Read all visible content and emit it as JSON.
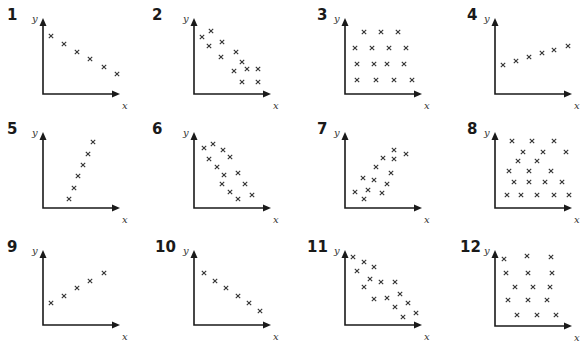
{
  "chart_data": [
    {
      "id": "1",
      "type": "scatter",
      "title": "1",
      "xlabel": "x",
      "ylabel": "y",
      "origin": [
        43,
        94
      ],
      "y_top": 18,
      "x_end": 120,
      "label_pos": [
        7,
        20
      ],
      "points": [
        [
          51,
          36
        ],
        [
          64,
          44
        ],
        [
          77,
          52
        ],
        [
          90,
          59
        ],
        [
          104,
          67
        ],
        [
          117,
          74
        ]
      ],
      "description": "perfect negative linear"
    },
    {
      "id": "2",
      "type": "scatter",
      "title": "2",
      "xlabel": "x",
      "ylabel": "y",
      "origin": [
        194,
        94
      ],
      "y_top": 18,
      "x_end": 271,
      "label_pos": [
        152,
        20
      ],
      "points": [
        [
          202,
          37
        ],
        [
          211,
          31
        ],
        [
          209,
          46
        ],
        [
          222,
          42
        ],
        [
          221,
          57
        ],
        [
          236,
          52
        ],
        [
          242,
          62
        ],
        [
          234,
          71
        ],
        [
          247,
          69
        ],
        [
          258,
          69
        ],
        [
          242,
          82
        ],
        [
          258,
          82
        ]
      ],
      "description": "strong negative"
    },
    {
      "id": "3",
      "type": "scatter",
      "title": "3",
      "xlabel": "x",
      "ylabel": "y",
      "origin": [
        345,
        94
      ],
      "y_top": 18,
      "x_end": 422,
      "label_pos": [
        317,
        20
      ],
      "points": [
        [
          364,
          32
        ],
        [
          381,
          32
        ],
        [
          398,
          32
        ],
        [
          355,
          48
        ],
        [
          372,
          48
        ],
        [
          389,
          48
        ],
        [
          406,
          48
        ],
        [
          357,
          64
        ],
        [
          374,
          64
        ],
        [
          387,
          64
        ],
        [
          404,
          64
        ],
        [
          357,
          80
        ],
        [
          376,
          80
        ],
        [
          394,
          80
        ],
        [
          412,
          80
        ]
      ],
      "description": "no correlation"
    },
    {
      "id": "4",
      "type": "scatter",
      "title": "4",
      "xlabel": "x",
      "ylabel": "y",
      "origin": [
        495,
        94
      ],
      "y_top": 18,
      "x_end": 572,
      "label_pos": [
        467,
        20
      ],
      "points": [
        [
          503,
          65
        ],
        [
          516,
          61
        ],
        [
          529,
          57
        ],
        [
          542,
          53
        ],
        [
          554,
          50
        ],
        [
          568,
          46
        ]
      ],
      "description": "perfect positive linear (shallow)"
    },
    {
      "id": "5",
      "type": "scatter",
      "title": "5",
      "xlabel": "x",
      "ylabel": "y",
      "origin": [
        43,
        208
      ],
      "y_top": 132,
      "x_end": 120,
      "label_pos": [
        7,
        134
      ],
      "points": [
        [
          69,
          199
        ],
        [
          74,
          188
        ],
        [
          78,
          176
        ],
        [
          83,
          165
        ],
        [
          88,
          154
        ],
        [
          93,
          142
        ]
      ],
      "description": "perfect positive linear (steep)"
    },
    {
      "id": "6",
      "type": "scatter",
      "title": "6",
      "xlabel": "x",
      "ylabel": "y",
      "origin": [
        194,
        208
      ],
      "y_top": 132,
      "x_end": 271,
      "label_pos": [
        152,
        134
      ],
      "points": [
        [
          204,
          148
        ],
        [
          213,
          144
        ],
        [
          223,
          150
        ],
        [
          230,
          157
        ],
        [
          209,
          159
        ],
        [
          217,
          167
        ],
        [
          224,
          175
        ],
        [
          238,
          173
        ],
        [
          222,
          184
        ],
        [
          245,
          184
        ],
        [
          230,
          192
        ],
        [
          252,
          195
        ],
        [
          238,
          199
        ]
      ],
      "description": "negative"
    },
    {
      "id": "7",
      "type": "scatter",
      "title": "7",
      "xlabel": "x",
      "ylabel": "y",
      "origin": [
        345,
        208
      ],
      "y_top": 132,
      "x_end": 422,
      "label_pos": [
        317,
        134
      ],
      "points": [
        [
          355,
          192
        ],
        [
          364,
          199
        ],
        [
          368,
          190
        ],
        [
          363,
          178
        ],
        [
          374,
          180
        ],
        [
          382,
          193
        ],
        [
          387,
          184
        ],
        [
          376,
          167
        ],
        [
          391,
          173
        ],
        [
          383,
          158
        ],
        [
          394,
          150
        ],
        [
          394,
          159
        ],
        [
          406,
          154
        ]
      ],
      "description": "positive"
    },
    {
      "id": "8",
      "type": "scatter",
      "title": "8",
      "xlabel": "x",
      "ylabel": "y",
      "origin": [
        495,
        208
      ],
      "y_top": 132,
      "x_end": 572,
      "label_pos": [
        467,
        134
      ],
      "points": [
        [
          512,
          141
        ],
        [
          532,
          141
        ],
        [
          554,
          141
        ],
        [
          523,
          152
        ],
        [
          543,
          152
        ],
        [
          566,
          152
        ],
        [
          518,
          161
        ],
        [
          537,
          161
        ],
        [
          509,
          171
        ],
        [
          529,
          171
        ],
        [
          551,
          171
        ],
        [
          514,
          182
        ],
        [
          529,
          182
        ],
        [
          545,
          182
        ],
        [
          562,
          182
        ],
        [
          507,
          195
        ],
        [
          521,
          195
        ],
        [
          537,
          195
        ],
        [
          554,
          195
        ],
        [
          569,
          195
        ]
      ],
      "description": "no correlation"
    },
    {
      "id": "9",
      "type": "scatter",
      "title": "9",
      "xlabel": "x",
      "ylabel": "y",
      "origin": [
        43,
        325
      ],
      "y_top": 250,
      "x_end": 120,
      "label_pos": [
        7,
        252
      ],
      "points": [
        [
          51,
          303
        ],
        [
          64,
          296
        ],
        [
          77,
          288
        ],
        [
          90,
          281
        ],
        [
          104,
          273
        ]
      ],
      "description": "perfect positive linear"
    },
    {
      "id": "10",
      "type": "scatter",
      "title": "10",
      "xlabel": "x",
      "ylabel": "y",
      "origin": [
        194,
        325
      ],
      "y_top": 250,
      "x_end": 271,
      "label_pos": [
        155,
        252
      ],
      "points": [
        [
          204,
          273
        ],
        [
          215,
          281
        ],
        [
          226,
          288
        ],
        [
          238,
          296
        ],
        [
          249,
          303
        ],
        [
          260,
          311
        ]
      ],
      "description": "perfect negative linear"
    },
    {
      "id": "11",
      "type": "scatter",
      "title": "11",
      "xlabel": "x",
      "ylabel": "y",
      "origin": [
        345,
        325
      ],
      "y_top": 250,
      "x_end": 422,
      "label_pos": [
        307,
        252
      ],
      "points": [
        [
          353,
          257
        ],
        [
          364,
          262
        ],
        [
          374,
          267
        ],
        [
          357,
          271
        ],
        [
          370,
          279
        ],
        [
          364,
          287
        ],
        [
          381,
          282
        ],
        [
          395,
          282
        ],
        [
          400,
          294
        ],
        [
          374,
          299
        ],
        [
          387,
          298
        ],
        [
          395,
          307
        ],
        [
          408,
          303
        ],
        [
          403,
          317
        ],
        [
          416,
          313
        ]
      ],
      "description": "strong negative"
    },
    {
      "id": "12",
      "type": "scatter",
      "title": "12",
      "xlabel": "x",
      "ylabel": "y",
      "origin": [
        495,
        326
      ],
      "y_top": 250,
      "x_end": 572,
      "label_pos": [
        460,
        252
      ],
      "points": [
        [
          504,
          259
        ],
        [
          527,
          256
        ],
        [
          551,
          257
        ],
        [
          506,
          273
        ],
        [
          528,
          273
        ],
        [
          552,
          273
        ],
        [
          515,
          287
        ],
        [
          533,
          287
        ],
        [
          550,
          287
        ],
        [
          508,
          300
        ],
        [
          528,
          300
        ],
        [
          547,
          300
        ],
        [
          517,
          315
        ],
        [
          537,
          315
        ],
        [
          556,
          315
        ]
      ],
      "description": "no correlation"
    }
  ]
}
